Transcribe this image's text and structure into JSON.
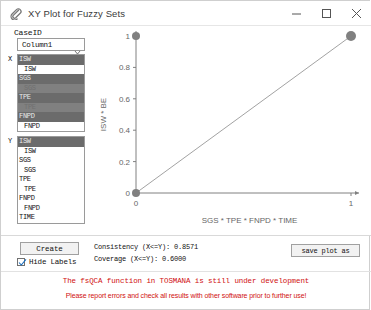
{
  "window": {
    "title": "XY Plot for Fuzzy Sets",
    "icon": "paperclip-icon",
    "minimize": "minimize-icon",
    "maximize": "maximize-icon",
    "close": "close-icon"
  },
  "left_panel": {
    "caseid_label": "CaseID",
    "caseid_value": "Column1",
    "x_marker": "X",
    "y_marker": "Y",
    "x_list": [
      {
        "label": "ISW",
        "selected": true,
        "indent": false
      },
      {
        "label": "ISW",
        "selected": false,
        "indent": true
      },
      {
        "label": "SGS",
        "selected": true,
        "indent": false
      },
      {
        "label": "SGS",
        "selected": true,
        "indent": true
      },
      {
        "label": "TPE",
        "selected": true,
        "indent": false
      },
      {
        "label": "TPE",
        "selected": true,
        "indent": true
      },
      {
        "label": "FNPD",
        "selected": true,
        "indent": false
      },
      {
        "label": "FNPD",
        "selected": false,
        "indent": true
      },
      {
        "label": "TIME",
        "selected": true,
        "indent": false
      },
      {
        "label": "TIME",
        "selected": false,
        "indent": true
      },
      {
        "label": "BE",
        "selected": false,
        "indent": false
      },
      {
        "label": "BE",
        "selected": false,
        "indent": true
      }
    ],
    "y_list": [
      {
        "label": "ISW",
        "selected": true,
        "indent": false
      },
      {
        "label": "ISW",
        "selected": false,
        "indent": true
      },
      {
        "label": "SGS",
        "selected": false,
        "indent": false
      },
      {
        "label": "SGS",
        "selected": false,
        "indent": true
      },
      {
        "label": "TPE",
        "selected": false,
        "indent": false
      },
      {
        "label": "TPE",
        "selected": false,
        "indent": true
      },
      {
        "label": "FNPD",
        "selected": false,
        "indent": false
      },
      {
        "label": "FNPD",
        "selected": false,
        "indent": true
      },
      {
        "label": "TIME",
        "selected": false,
        "indent": false
      },
      {
        "label": "TIME",
        "selected": false,
        "indent": true
      },
      {
        "label": "BE",
        "selected": true,
        "indent": false
      },
      {
        "label": "BE",
        "selected": false,
        "indent": true
      }
    ]
  },
  "bottom": {
    "create_label": "Create",
    "hide_labels_label": "Hide Labels",
    "hide_labels_checked": true,
    "consistency": "Consistency (X<=Y): 0.8571",
    "coverage": "Coverage (X<=Y): 0.6000",
    "save_plot_label": "save plot as",
    "warning_line1": "The fsQCA function in TOSMANA is still under development",
    "warning_line2": "Please report errors and check all results with other software prior to further use!"
  },
  "chart_data": {
    "type": "scatter",
    "title": "",
    "xlabel": "SGS * TPE * FNPD * TIME",
    "ylabel": "ISW * BE",
    "xlim": [
      0,
      1
    ],
    "ylim": [
      0,
      1
    ],
    "xticks": [
      0,
      1
    ],
    "xticklabels": [
      "0",
      "1"
    ],
    "yticks": [
      0,
      0.2,
      0.4,
      0.6,
      0.8,
      1
    ],
    "yticklabels": [
      "0",
      "0.2",
      "0.4",
      "0.6",
      "0.8",
      "1"
    ],
    "grid": false,
    "legend": false,
    "points": [
      {
        "x": 0,
        "y": 1,
        "size": 4
      },
      {
        "x": 0,
        "y": 0,
        "size": 4
      },
      {
        "x": 1,
        "y": 1,
        "size": 5
      }
    ],
    "diagonal_line": {
      "from": [
        0,
        0
      ],
      "to": [
        1,
        1
      ]
    },
    "point_color": "#808080",
    "axis_color": "#808080"
  }
}
